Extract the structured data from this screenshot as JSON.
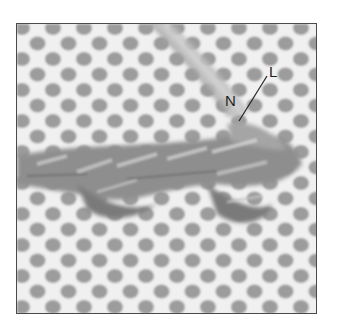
{
  "figure": {
    "labels": [
      {
        "id": "N",
        "text": "N"
      },
      {
        "id": "L",
        "text": "L"
      }
    ],
    "colors": {
      "canvas_thread": "#f2f2f2",
      "hole": "#9a9a9a",
      "yarn_dark": "#6e6e6e",
      "yarn_light": "#c8c8c8",
      "frame_border": "#4a4a4a",
      "label_text": "#1e1e1e"
    }
  }
}
